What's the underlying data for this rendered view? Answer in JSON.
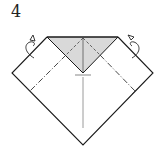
{
  "step": {
    "number": "4"
  },
  "diagram": {
    "colors": {
      "outline": "#1a1a1a",
      "shade_fill": "#d9d9d9",
      "center_line": "#9a9a9a",
      "fold_line": "#333333"
    },
    "icons": [
      "turn-over-arrow-left",
      "turn-over-arrow-right"
    ]
  }
}
